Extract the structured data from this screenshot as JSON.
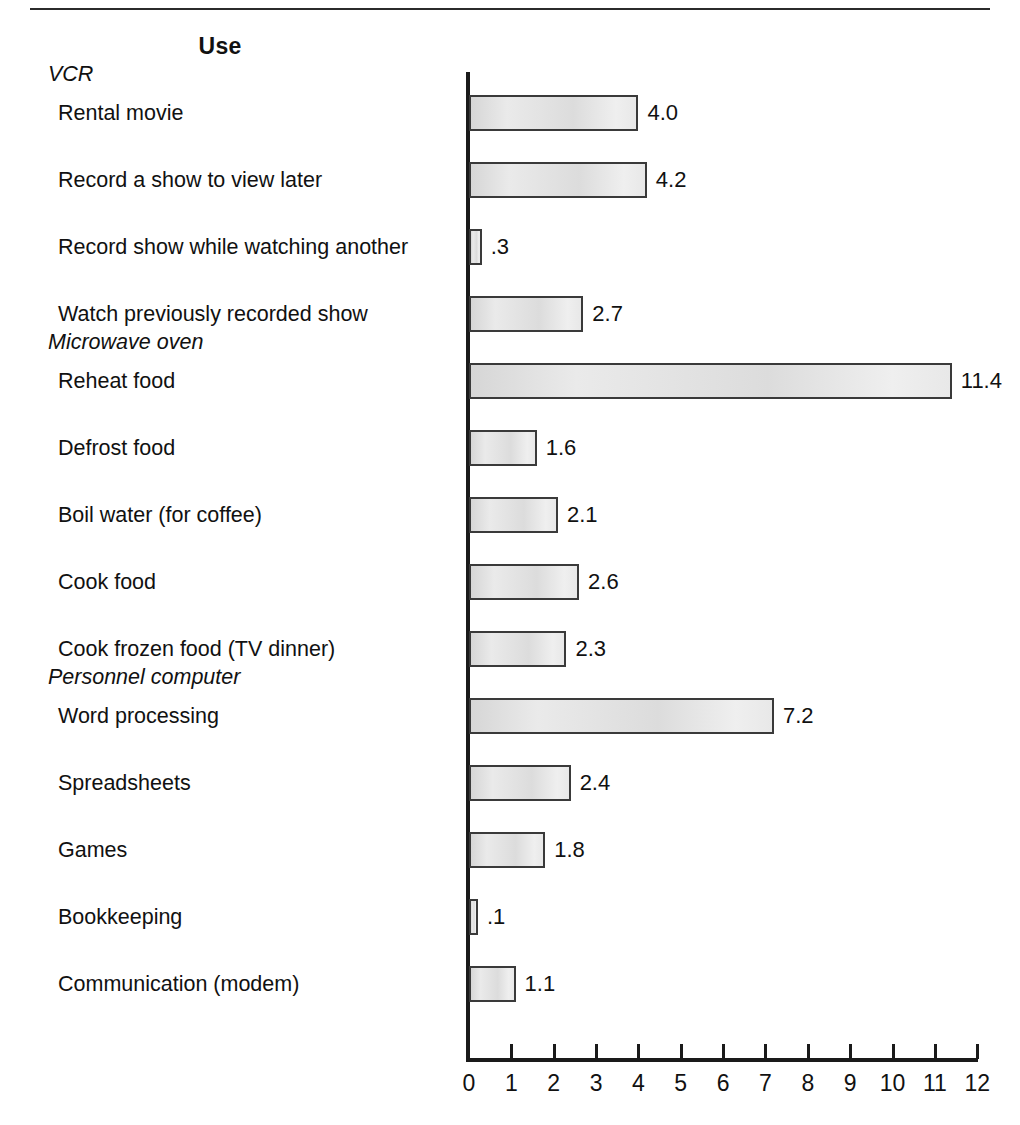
{
  "header": {
    "title": "Use"
  },
  "chart_data": {
    "type": "bar",
    "orientation": "horizontal",
    "title": "Use",
    "xlabel": "",
    "ylabel": "",
    "xlim": [
      0,
      12
    ],
    "xticks": [
      "0",
      "1",
      "2",
      "3",
      "4",
      "5",
      "6",
      "7",
      "8",
      "9",
      "10",
      "11",
      "12"
    ],
    "grid": false,
    "legend": false,
    "groups": [
      {
        "name": "VCR",
        "categories": [
          "Rental movie",
          "Record a show to view later",
          "Record show while watching another",
          "Watch previously recorded show"
        ],
        "values": [
          4.0,
          4.2,
          0.3,
          2.7
        ],
        "labels": [
          "4.0",
          "4.2",
          ".3",
          "2.7"
        ]
      },
      {
        "name": "Microwave oven",
        "categories": [
          "Reheat food",
          "Defrost food",
          "Boil water (for coffee)",
          "Cook food",
          "Cook frozen food (TV dinner)"
        ],
        "values": [
          11.4,
          1.6,
          2.1,
          2.6,
          2.3
        ],
        "labels": [
          "11.4",
          "1.6",
          "2.1",
          "2.6",
          "2.3"
        ]
      },
      {
        "name": "Personnel computer",
        "categories": [
          "Word processing",
          "Spreadsheets",
          "Games",
          "Bookkeeping",
          "Communication (modem)"
        ],
        "values": [
          7.2,
          2.4,
          1.8,
          0.1,
          1.1
        ],
        "labels": [
          "7.2",
          "2.4",
          "1.8",
          ".1",
          "1.1"
        ]
      }
    ],
    "categories": [
      "Rental movie",
      "Record a show to view later",
      "Record show while watching another",
      "Watch previously recorded show",
      "Reheat food",
      "Defrost food",
      "Boil water (for coffee)",
      "Cook food",
      "Cook frozen food (TV dinner)",
      "Word processing",
      "Spreadsheets",
      "Games",
      "Bookkeeping",
      "Communication (modem)"
    ],
    "values": [
      4.0,
      4.2,
      0.3,
      2.7,
      11.4,
      1.6,
      2.1,
      2.6,
      2.3,
      7.2,
      2.4,
      1.8,
      0.1,
      1.1
    ],
    "value_labels": [
      "4.0",
      "4.2",
      ".3",
      "2.7",
      "11.4",
      "1.6",
      "2.1",
      "2.6",
      "2.3",
      "7.2",
      "2.4",
      "1.8",
      ".1",
      "1.1"
    ],
    "colors": {
      "bar_fill": "#e6e6e6",
      "bar_border": "#3a3a3a",
      "axis": "#1a1a1a",
      "text": "#111111"
    }
  }
}
